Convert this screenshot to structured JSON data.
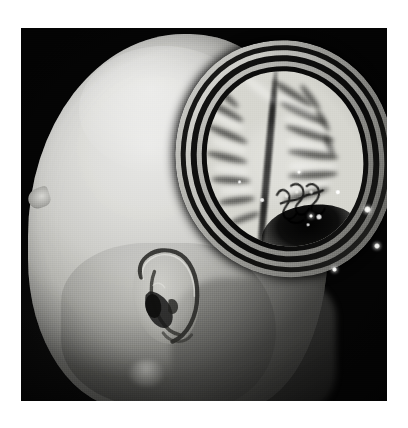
{
  "figure": {
    "caption": "",
    "modality": "MRI",
    "view": "lateral 3D surface rendering with cutaway",
    "colorspace": "grayscale",
    "background_color": "#ffffff",
    "panel_color": "#050505"
  },
  "panel": {
    "x": 21,
    "y": 28,
    "width": 366,
    "height": 373,
    "border_color": "#fdfdfd"
  },
  "anatomy": {
    "head": {
      "label": "head-surface-render",
      "description": "Volume-rendered lateral view of a head, face toward the left",
      "highlight_color": "#e4e4e2",
      "shadow_color": "#6a6a66"
    },
    "ear": {
      "label": "ear-pinna",
      "parts": [
        "helix",
        "antihelix",
        "concha",
        "tragus",
        "lobule"
      ]
    },
    "nose": {
      "label": "nose-brow-protrusion"
    },
    "neck": {
      "label": "neck-region"
    },
    "cutaway": {
      "label": "skull-cutaway-window",
      "description": "Quadrant of calvarium removed exposing an axial brain slice",
      "layers": [
        "outer-scalp",
        "outer-table-dark",
        "diploe-bright",
        "inner-dark",
        "inner-table",
        "csf-space"
      ]
    },
    "brain": {
      "label": "brain-parenchyma",
      "features": [
        "interhemispheric-fissure",
        "cerebral-gyri",
        "cerebral-sulci",
        "white-matter",
        "gray-matter-cortex"
      ],
      "tissue_color": "#cfcfc9",
      "sulcus_color": "#1a1a19"
    },
    "lesion": {
      "label": "vascular-tangle-cluster",
      "location": "infero-posterior parietal"
    },
    "cavity": {
      "label": "inferior-dark-cavity"
    },
    "fiducials": {
      "label": "fiducial-markers",
      "count": 5,
      "color": "#ffffff"
    }
  },
  "chart_data": {
    "type": "heatmap",
    "title": "",
    "xlabel": "",
    "ylabel": "",
    "legend": [],
    "grid": false
  }
}
